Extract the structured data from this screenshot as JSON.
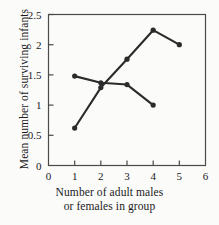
{
  "chart_data": {
    "type": "line",
    "title": "",
    "subtitle": "",
    "xlabel": "Number of adult males or females in group",
    "xlabel_lines": [
      "Number of adult males",
      "or females in group"
    ],
    "ylabel": "Mean number of surviving infants",
    "xlim": [
      0,
      6
    ],
    "ylim": [
      0,
      2.5
    ],
    "xticks": [
      "0",
      "1",
      "2",
      "3",
      "4",
      "5",
      "6"
    ],
    "xtick_values": [
      0,
      1,
      2,
      3,
      4,
      5,
      6
    ],
    "yticks": [
      "0",
      "0.5",
      "1",
      "1.5",
      "2",
      "2.5"
    ],
    "ytick_values": [
      0,
      0.5,
      1,
      1.5,
      2,
      2.5
    ],
    "grid": false,
    "legend": "none",
    "marker": "filled-circle",
    "line_color": "#2b2b2b",
    "series": [
      {
        "name": "rising-series",
        "x": [
          1,
          2,
          3,
          4,
          5
        ],
        "values": [
          0.62,
          1.29,
          1.76,
          2.24,
          2.0
        ]
      },
      {
        "name": "declining-series",
        "x": [
          1,
          2,
          3,
          4
        ],
        "values": [
          1.48,
          1.37,
          1.34,
          1.0
        ]
      }
    ]
  },
  "figure": {
    "background_color": "#fbfbfa",
    "axis_color": "#4a4a4a"
  }
}
